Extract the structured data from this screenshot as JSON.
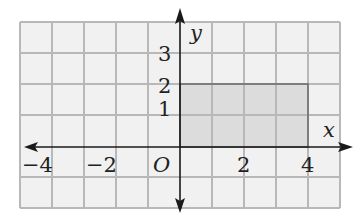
{
  "figure": {
    "type": "coordinate-plane",
    "axes": {
      "x_label": "x",
      "y_label": "y",
      "origin_label": "O",
      "x_range": [
        -5,
        5
      ],
      "y_range": [
        -2,
        4
      ],
      "x_tick_labels": [
        {
          "value": -4,
          "text": "−4"
        },
        {
          "value": -2,
          "text": "−2"
        },
        {
          "value": 2,
          "text": "2"
        },
        {
          "value": 4,
          "text": "4"
        }
      ],
      "y_tick_labels": [
        {
          "value": 1,
          "text": "1"
        },
        {
          "value": 2,
          "text": "2"
        },
        {
          "value": 3,
          "text": "3"
        }
      ]
    },
    "grid": {
      "columns": 10,
      "rows": 6,
      "color": "#b8b8b8",
      "background": "#f1f1f1"
    },
    "shaded_region": {
      "shape": "rectangle",
      "vertices": [
        [
          0,
          0
        ],
        [
          4,
          0
        ],
        [
          4,
          2
        ],
        [
          0,
          2
        ]
      ],
      "fill": "#dcdcdc",
      "stroke": "#6a6a6a"
    }
  },
  "labels": {
    "x_axis": "x",
    "y_axis": "y",
    "origin": "O",
    "xt_m4": "−4",
    "xt_m2": "−2",
    "xt_2": "2",
    "xt_4": "4",
    "yt_1": "1",
    "yt_2": "2",
    "yt_3": "3"
  }
}
